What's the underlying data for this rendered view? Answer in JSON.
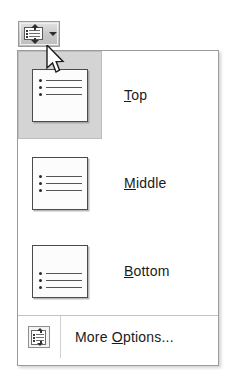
{
  "toolbar": {
    "button_name": "Vertical Alignment",
    "icon": "vertical-align-icon",
    "caret": "dropdown-arrow-icon",
    "state": "pressed"
  },
  "menu": {
    "title": "Vertical Alignment",
    "items": [
      {
        "label": "Top",
        "accel_prefix": "T",
        "accel_rest": "op",
        "icon": "align-top-icon",
        "selected": true,
        "alignment": "top"
      },
      {
        "label": "Middle",
        "accel_prefix": "M",
        "accel_rest": "iddle",
        "icon": "align-middle-icon",
        "selected": false,
        "alignment": "middle"
      },
      {
        "label": "Bottom",
        "accel_prefix": "B",
        "accel_rest": "ottom",
        "icon": "align-bottom-icon",
        "selected": false,
        "alignment": "bottom"
      }
    ],
    "footer": {
      "label": "More Options...",
      "accel_head": "More ",
      "accel_prefix": "O",
      "accel_rest": "ptions...",
      "icon": "more-options-icon"
    }
  },
  "cursor": {
    "type": "arrow-pointer"
  },
  "colors": {
    "menu_background": "#ffffff",
    "menu_border": "#9c9c9c",
    "selected_highlight": "#d4d4d4",
    "separator": "#c3c3c3",
    "text": "#1a1a1a",
    "button_face": "#c9c9c9",
    "button_border": "#9a9a9a"
  }
}
